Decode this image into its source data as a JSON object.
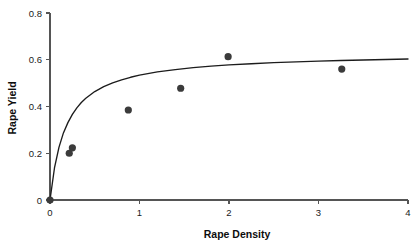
{
  "chart_data": {
    "type": "scatter",
    "title": "",
    "xlabel": "Rape Density",
    "ylabel": "Rape Yield",
    "xlim": [
      0,
      4
    ],
    "ylim": [
      0,
      0.8
    ],
    "grid": false,
    "legend": null,
    "x_ticks": [
      "0",
      "1",
      "2",
      "3",
      "4"
    ],
    "x_tick_values": [
      0,
      1,
      2,
      3,
      4
    ],
    "y_ticks": [
      "0",
      "0.2",
      "0.4",
      "0.6",
      "0.8"
    ],
    "y_tick_values": [
      0,
      0.2,
      0.4,
      0.6,
      0.8
    ],
    "point_color": "#3b3b3b",
    "curve_color": "#1c1c1c",
    "axis_color": "#555555",
    "series": [
      {
        "name": "observations",
        "type": "scatter",
        "marker": "filled-circle",
        "x": [
          0,
          0.215,
          0.25,
          0.875,
          1.46,
          1.99,
          3.26
        ],
        "y": [
          0,
          0.2,
          0.223,
          0.385,
          0.478,
          0.613,
          0.56
        ]
      },
      {
        "name": "fitted curve",
        "type": "line",
        "model": "asymptotic",
        "x": [
          0,
          0.05,
          0.1,
          0.15,
          0.2,
          0.25,
          0.3,
          0.35,
          0.4,
          0.5,
          0.6,
          0.7,
          0.8,
          0.9,
          1.0,
          1.2,
          1.4,
          1.6,
          1.8,
          2.0,
          2.25,
          2.5,
          2.75,
          3.0,
          3.25,
          3.5,
          3.75,
          4.0
        ],
        "y": [
          0,
          0.137,
          0.225,
          0.287,
          0.331,
          0.366,
          0.394,
          0.417,
          0.435,
          0.464,
          0.485,
          0.501,
          0.514,
          0.525,
          0.534,
          0.548,
          0.558,
          0.566,
          0.573,
          0.578,
          0.583,
          0.588,
          0.591,
          0.594,
          0.597,
          0.599,
          0.601,
          0.603
        ]
      }
    ]
  },
  "axes": {
    "x_title": "Rape Density",
    "y_title": "Rape Yield"
  }
}
